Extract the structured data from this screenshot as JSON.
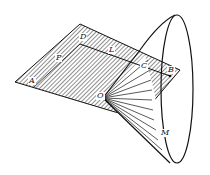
{
  "figure": {
    "colors": {
      "ink": "#111111",
      "background": "#ffffff"
    },
    "labels": {
      "A": "A",
      "P": "P",
      "D": "D",
      "L": "L",
      "C": "C",
      "B": "B",
      "O": "O",
      "M": "M"
    }
  }
}
